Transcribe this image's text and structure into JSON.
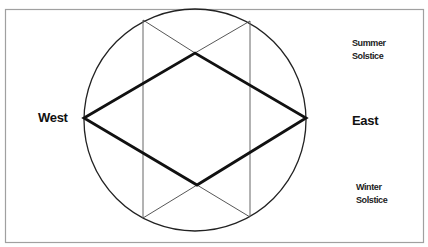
{
  "diagram": {
    "labels": {
      "west": "West",
      "east": "East",
      "summer_solstice_line1": "Summer",
      "summer_solstice_line2": "Solstice",
      "winter_solstice_line1": "Winter",
      "winter_solstice_line2": "Solstice"
    },
    "colors": {
      "background": "#ffffff",
      "frame": "#9a9a9a",
      "circle": "#222222",
      "thin_lines": "#555555",
      "diamond": "#111111",
      "text": "#111111"
    },
    "geometry": {
      "frame": {
        "x": 5,
        "y": 9,
        "width": 419,
        "height": 234
      },
      "circle": {
        "cx": 195,
        "cy": 120,
        "r": 111
      },
      "vertical_lines_x": [
        143,
        250
      ],
      "diamond_points": {
        "west": [
          84,
          118
        ],
        "top": [
          195,
          53
        ],
        "east": [
          306,
          118
        ],
        "bottom": [
          197,
          185
        ]
      }
    }
  }
}
